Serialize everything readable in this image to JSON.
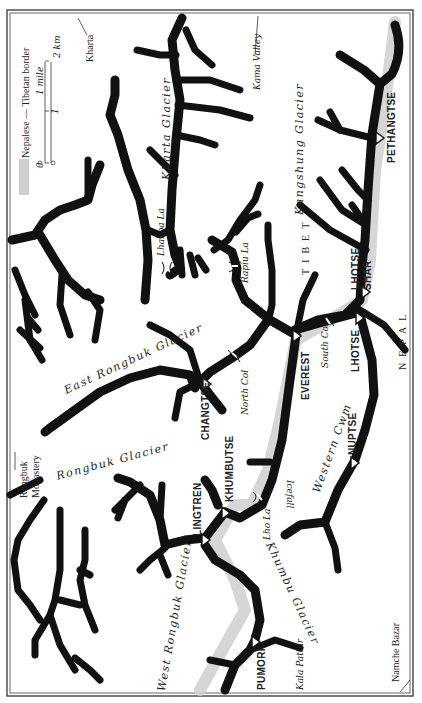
{
  "map": {
    "title": "Everest region",
    "orientation": "rotated 90 degrees counter-clockwise (north at left)",
    "legend": {
      "border_label": "Nepalese — Tibetan border",
      "border_swatch_color": "#cfcfcf",
      "scale": {
        "zero": "0",
        "mile_unit": "1 mile",
        "km_mid": "1",
        "km_unit": "2 km"
      }
    },
    "peaks": [
      {
        "name": "PETHANGTSE"
      },
      {
        "name": "LHOTSE SHAR"
      },
      {
        "name": "LHOTSE"
      },
      {
        "name": "EVEREST"
      },
      {
        "name": "CHANGTSE"
      },
      {
        "name": "NUPTSE"
      },
      {
        "name": "KHUMBUTSE"
      },
      {
        "name": "LINGTREN"
      },
      {
        "name": "PUMORI"
      }
    ],
    "peaks_labels": {
      "pethangtse": "PETHANGTSE",
      "lhotse_shar_1": "LHOTSE",
      "lhotse_shar_2": "SHAR",
      "lhotse": "LHOTSE",
      "everest": "EVEREST",
      "changtse": "CHANGTSE",
      "nuptse": "NUPTSE",
      "khumbutse": "KHUMBUTSE",
      "lingtren": "LINGTREN",
      "pumori": "PUMORI"
    },
    "passes": {
      "lhakpa_la": "Lhakpa La",
      "rapiu_la": "Rapiu La",
      "north_col": "North Col",
      "south_col": "South Col",
      "lho_la": "Lho La"
    },
    "glaciers": {
      "kharta": "Kharta Glacier",
      "kangshung": "Kangshung Glacier",
      "east_rongbuk": "East Rongbuk Glacier",
      "rongbuk": "Rongbuk Glacier",
      "west_rongbuk": "West Rongbuk Glacier",
      "khumbu": "Khumbu Glacier",
      "icefall": "Icefall",
      "western_cwm": "Western Cwm"
    },
    "regions": {
      "tibet": "TIBET",
      "nepal": "NEPAL"
    },
    "places": {
      "kharta": "Kharta",
      "kama_valley": "Kama Valley",
      "rongbuk_monastery_1": "Rongbuk",
      "rongbuk_monastery_2": "Monastery",
      "kala_pattar": "Kala Pattar",
      "namche_bazar": "Namche Bazar"
    }
  }
}
